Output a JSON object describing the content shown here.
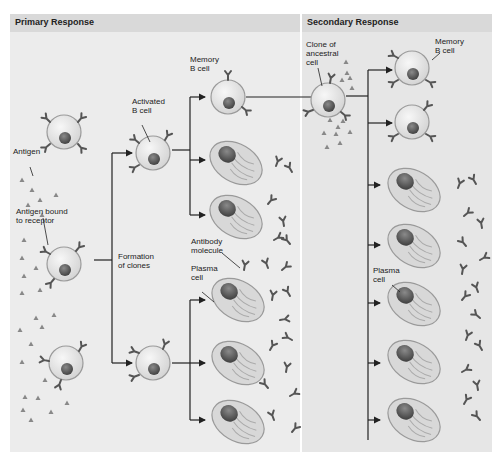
{
  "panels": {
    "primary": {
      "title": "Primary Response"
    },
    "secondary": {
      "title": "Secondary Response"
    }
  },
  "labels": {
    "antigen": "Antigen",
    "antigen_bound": "Antigen bound\nto receptor",
    "formation_of_clones": "Formation\nof clones",
    "activated_b_cell": "Activated\nB cell",
    "memory_b_cell_primary": "Memory\nB cell",
    "antibody_molecule": "Antibody\nmolecule",
    "plasma_cell_primary": "Plasma\ncell",
    "clone_of_ancestral_cell": "Clone of\nancestral\ncell",
    "memory_b_cell_secondary": "Memory\nB cell",
    "plasma_cell_secondary": "Plasma\ncell"
  },
  "colors": {
    "panel_primary": "#ececec",
    "panel_secondary": "#e6e6e6",
    "header": "#d9d9d9",
    "cell_fill": "#e2e2e2",
    "cell_stroke": "#9a9a9a",
    "nucleus": "#5a5a5a",
    "antibody": "#555555",
    "antigen": "#888888",
    "arrow": "#222222"
  }
}
